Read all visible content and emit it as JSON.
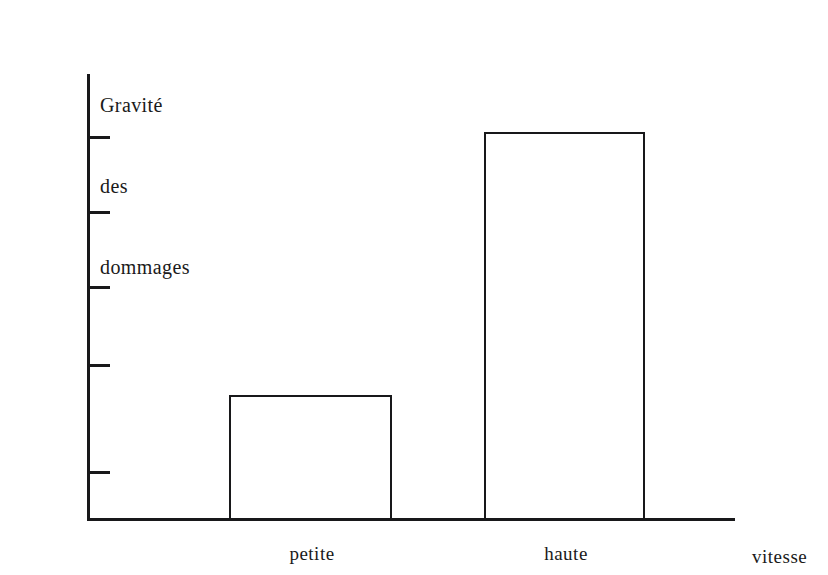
{
  "chart_data": {
    "type": "bar",
    "title": "",
    "subtitle": "",
    "categories": [
      "petite",
      "haute"
    ],
    "values": [
      28,
      87
    ],
    "series": [
      {
        "name": "Gravité des dommages",
        "values": [
          28,
          87
        ]
      }
    ],
    "xlabel": "vitesse",
    "ylabel": "Gravité des dommages",
    "ylabel_lines": [
      "Gravité",
      "des",
      "dommages"
    ],
    "ylim": [
      0,
      100
    ],
    "xlim": [
      0,
      100
    ],
    "y_tick_labels": [
      "",
      "",
      "",
      "",
      ""
    ],
    "y_tick_values": [
      86,
      69,
      52,
      35,
      11
    ],
    "x_tick_labels": [
      "petite",
      "haute"
    ],
    "grid": false,
    "legend": false,
    "legend_position": "none",
    "bar_fill": "none",
    "annotations": []
  },
  "style": {
    "background_color": "#ffffff",
    "ink_color": "#18181a",
    "bar_fill_color": "transparent",
    "bar_stroke_color": "#18181a"
  },
  "labels": {
    "y_axis_line_1": "Gravité",
    "y_axis_line_2": "des",
    "y_axis_line_3": "dommages",
    "x_axis": "vitesse",
    "category_1": "petite",
    "category_2": "haute"
  }
}
